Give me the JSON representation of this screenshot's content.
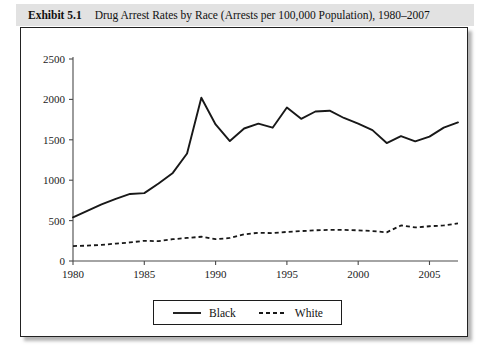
{
  "caption": {
    "label": "Exhibit 5.1",
    "text": "Drug Arrest Rates by Race (Arrests per 100,000 Population), 1980–2007"
  },
  "legend": {
    "position": "bottom-center",
    "entries": [
      {
        "name": "Black",
        "style": "solid"
      },
      {
        "name": "White",
        "style": "dashed"
      }
    ]
  },
  "chart_data": {
    "type": "line",
    "title": "Drug Arrest Rates by Race (Arrests per 100,000 Population), 1980–2007",
    "xlabel": "",
    "ylabel": "",
    "xlim": [
      1980,
      2007
    ],
    "ylim": [
      0,
      2500
    ],
    "xticks": [
      1980,
      1985,
      1990,
      1995,
      2000,
      2005
    ],
    "yticks": [
      0,
      500,
      1000,
      1500,
      2000,
      2500
    ],
    "grid": false,
    "x": [
      1980,
      1981,
      1982,
      1983,
      1984,
      1985,
      1986,
      1987,
      1988,
      1989,
      1990,
      1991,
      1992,
      1993,
      1994,
      1995,
      1996,
      1997,
      1998,
      1999,
      2000,
      2001,
      2002,
      2003,
      2004,
      2005,
      2006,
      2007
    ],
    "series": [
      {
        "name": "Black",
        "style": "solid",
        "color": "#181818",
        "values": [
          540,
          620,
          700,
          770,
          830,
          840,
          960,
          1090,
          1330,
          2020,
          1690,
          1485,
          1640,
          1700,
          1650,
          1900,
          1760,
          1850,
          1860,
          1770,
          1700,
          1620,
          1460,
          1545,
          1480,
          1540,
          1650,
          1715
        ]
      },
      {
        "name": "White",
        "style": "dashed",
        "color": "#181818",
        "values": [
          185,
          190,
          200,
          215,
          230,
          250,
          245,
          270,
          285,
          300,
          270,
          285,
          330,
          350,
          345,
          360,
          370,
          380,
          385,
          385,
          380,
          370,
          355,
          440,
          415,
          430,
          440,
          465
        ]
      }
    ]
  }
}
